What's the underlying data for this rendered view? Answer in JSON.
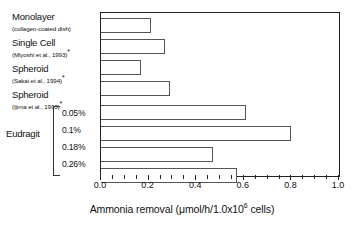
{
  "chart_data": {
    "type": "bar",
    "orientation": "horizontal",
    "title": "",
    "xlabel": "Ammonia removal (μmol/h/1.0x10⁶ cells)",
    "ylabel": "",
    "xlim": [
      0.0,
      1.0
    ],
    "xticks": [
      "0.0",
      "0.2",
      "0.4",
      "0.6",
      "0.8",
      "1.0"
    ],
    "xtick_values": [
      0.0,
      0.2,
      0.4,
      0.6,
      0.8,
      1.0
    ],
    "minor_tick_step": 0.05,
    "grid": false,
    "legend": "none",
    "categories": [
      "Monolayer (collagen-coated dish)",
      "Single Cell (Miyoshi et al., 1993) *",
      "Spheroid (Sakai et al., 1994) *",
      "Spheroid (Ijima et al., 1993) *",
      "Eudragit 0.05%",
      "Eudragit 0.1%",
      "Eudragit 0.18%",
      "Eudragit 0.26%"
    ],
    "values": [
      0.21,
      0.27,
      0.17,
      0.29,
      0.61,
      0.8,
      0.47,
      0.57
    ],
    "bar_facecolor": "#ffffff",
    "bar_edgecolor": "#555555",
    "axis_color": "#222222"
  },
  "labels": {
    "items": [
      {
        "main": "Monolayer",
        "sub": "(collagen-coated dish)",
        "star": ""
      },
      {
        "main": "Single Cell",
        "sub": "(Miyoshi et al., 1993)",
        "star": "*"
      },
      {
        "main": "Spheroid",
        "sub": "(Sakai et al., 1994)",
        "star": "*"
      },
      {
        "main": "Spheroid",
        "sub": "(Ijima et al., 1993)",
        "star": "*"
      }
    ]
  },
  "group": {
    "name": "Eudragit",
    "percents": [
      "0.05%",
      "0.1%",
      "0.18%",
      "0.26%"
    ]
  },
  "axis": {
    "title_prefix": "Ammonia removal (μmol/h/1.0x10",
    "title_exponent": "6",
    "title_suffix": " cells)",
    "ticks": [
      "0.0",
      "0.2",
      "0.4",
      "0.6",
      "0.8",
      "1.0"
    ]
  }
}
